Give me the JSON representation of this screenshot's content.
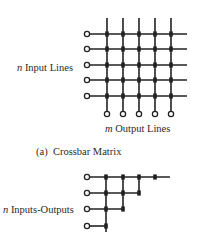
{
  "crossbar": {
    "input_label_var": "n",
    "input_label_text": " Input Lines",
    "output_label_var": "m",
    "output_label_text": " Output Lines",
    "caption": "(a)  Crossbar Matrix",
    "rows_y": [
      34,
      49,
      65,
      80,
      96
    ],
    "cols_x": [
      107,
      123,
      139,
      155,
      171
    ],
    "input_circle_x": 87,
    "line_right_x": 187,
    "col_top_y": 18,
    "output_circle_y": 114
  },
  "triangular": {
    "label_var": "n",
    "label_text": " Inputs-Outputs",
    "rows_y": [
      177,
      193,
      209,
      226
    ],
    "cols_x": [
      106,
      123,
      139,
      155
    ],
    "input_circle_x": 87,
    "top_line_right_x": 170,
    "bottom_y": 232
  },
  "colors": {
    "line": "#222222",
    "circle_fill": "#ffffff"
  }
}
